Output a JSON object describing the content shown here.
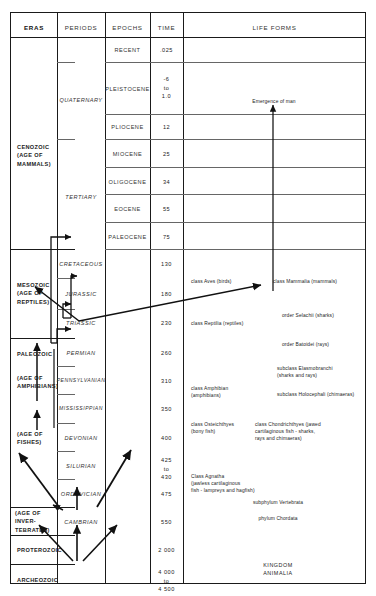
{
  "table": {
    "headers": {
      "eras": "ERAS",
      "periods": "PERIODS",
      "epochs": "EPOCHS",
      "time": "TIME",
      "life_forms": "LIFE FORMS"
    },
    "eras": [
      {
        "label": "CENOZOIC\n(AGE OF\nMAMMALS)"
      },
      {
        "label": "MESOZOIC\n(AGE OF\nREPTILES)"
      },
      {
        "label": "PALEOZOIC"
      },
      {
        "label": "(AGE OF\nAMPHIBIANS)"
      },
      {
        "label": "(AGE OF\nFISHES)"
      },
      {
        "label": "(AGE OF INVER-\nTEBRATES)"
      },
      {
        "label": "PROTEROZOIC"
      },
      {
        "label": "ARCHEOZOIC"
      }
    ],
    "periods": [
      {
        "label": "QUATERNARY"
      },
      {
        "label": "TERTIARY"
      },
      {
        "label": "CRETACEOUS"
      },
      {
        "label": "JURASSIC"
      },
      {
        "label": "TRIASSIC"
      },
      {
        "label": "PERMIAN"
      },
      {
        "label": "PENNSYLVANIAN"
      },
      {
        "label": "MISSISSIPPIAN"
      },
      {
        "label": "DEVONIAN"
      },
      {
        "label": "SILURIAN"
      },
      {
        "label": "ORDOVICIAN"
      },
      {
        "label": "CAMBRIAN"
      }
    ],
    "epochs": [
      {
        "label": "RECENT"
      },
      {
        "label": "PLEISTOCENE"
      },
      {
        "label": "PLIOCENE"
      },
      {
        "label": "MIOCENE"
      },
      {
        "label": "OLIGOCENE"
      },
      {
        "label": "EOCENE"
      },
      {
        "label": "PALEOCENE"
      }
    ],
    "times": [
      {
        "label": ".025"
      },
      {
        "label": "-6\nto\n1.0"
      },
      {
        "label": "12"
      },
      {
        "label": "25"
      },
      {
        "label": "34"
      },
      {
        "label": "55"
      },
      {
        "label": "75"
      },
      {
        "label": "130"
      },
      {
        "label": "180"
      },
      {
        "label": "230"
      },
      {
        "label": "260"
      },
      {
        "label": "310"
      },
      {
        "label": "350"
      },
      {
        "label": "400"
      },
      {
        "label": "425\nto\n430"
      },
      {
        "label": "475"
      },
      {
        "label": "550"
      },
      {
        "label": "2 000"
      },
      {
        "label": "4 000\nto\n4 500"
      }
    ]
  },
  "life_forms": {
    "emergence_of_man": "Emergence of man",
    "aves": "class Aves (birds)",
    "mammalia": "class Mammalia (mammals)",
    "selachii": "order Selachii (sharks)",
    "batoidei": "order Batoidei (rays)",
    "elasmobranchi": "subclass Elasmobranchi\n(sharks and rays)",
    "holocephali": "subclass Holocephali (chimaeras)",
    "reptilia": "class Reptilia (reptiles)",
    "amphibian": "class Amphibian\n(amphibians)",
    "osteichthyes": "class Osteichthyes\n        (bony fish)",
    "chondrichthyes": "class Chondrichthyes (jawed\ncartilaginous fish - sharks,\nrays and chimaeras)",
    "agnatha": "Class Agnatha\n(jawless cartilaginous\nfish - lampreys and hagfish)",
    "vertebrata": "subphylum Vertebrata",
    "chordata": "phylum Chordata",
    "kingdom_animalia": "KINGDOM\nANIMALIA"
  },
  "colors": {
    "ink": "#1a1a1a",
    "text": "#222222",
    "background": "#ffffff"
  }
}
